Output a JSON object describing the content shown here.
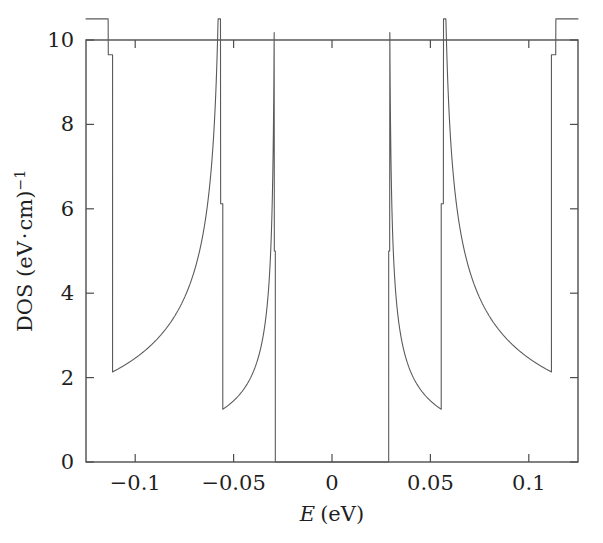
{
  "chart_data": {
    "type": "line",
    "title": "",
    "subtitle": "",
    "xlabel": "E (eV)",
    "xlabel_symbol": "E",
    "xlabel_units": "(eV)",
    "ylabel": "DOS (eV·cm)⁻¹",
    "ylabel_main": "DOS (eV",
    "ylabel_middot": "·",
    "ylabel_cm": "cm)",
    "ylabel_exponent": "−1",
    "xlim": [
      -0.125,
      0.125
    ],
    "ylim": [
      0,
      10
    ],
    "xticks": [
      -0.1,
      -0.05,
      0,
      0.05,
      0.1
    ],
    "xtick_labels": [
      "−0.1",
      "−0.05",
      "0",
      "0.05",
      "0.1"
    ],
    "yticks": [
      0,
      2,
      4,
      6,
      8,
      10
    ],
    "ytick_labels": [
      "0",
      "2",
      "4",
      "6",
      "8",
      "10"
    ],
    "grid": false,
    "legend": "none",
    "line_color": "#5a5a5a",
    "line_width": 1.1,
    "axes_color": "#4d4d4d",
    "background": "#ffffff",
    "tick_direction": "in",
    "box_frame": true,
    "series": [
      {
        "name": "DOS",
        "description": "Density of states of a semiconducting carbon nanotube showing van Hove singularities, symmetric about E = 0, with a band gap between −0.029 eV and +0.029 eV.",
        "band_gap_eV": 0.0576,
        "gap_edges_eV": [
          -0.0288,
          0.0288
        ],
        "singularities_eV": [
          -0.1115,
          -0.0555,
          -0.0288,
          0.0288,
          0.0555,
          0.1115
        ],
        "singularity_peak_values": [
          9.65,
          6.12,
          5.0,
          5.0,
          6.12,
          9.65
        ],
        "plateau_values": [
          2.25,
          1.15,
          0.0,
          1.15,
          2.25
        ],
        "edge_values": [
          4.24,
          4.24
        ],
        "subbands": [
          {
            "index": 1,
            "onset_eV": 0.0288,
            "prefactor": 2.06,
            "step_value": 5.0,
            "asymptote": 1.15
          },
          {
            "index": 2,
            "onset_eV": 0.0555,
            "prefactor": 2.76,
            "step_value": 6.12,
            "asymptote": 1.1
          },
          {
            "index": 3,
            "onset_eV": 0.1115,
            "prefactor": 4.4,
            "step_value": 9.65,
            "asymptote": 2.25
          }
        ],
        "points": [
          {
            "x": -0.125,
            "y": 4.24
          },
          {
            "x": -0.1115,
            "y": 9.65
          },
          {
            "x": -0.1114,
            "y": 2.25
          },
          {
            "x": -0.09,
            "y": 2.25
          },
          {
            "x": -0.07,
            "y": 2.45
          },
          {
            "x": -0.06,
            "y": 3.1
          },
          {
            "x": -0.0556,
            "y": 6.12
          },
          {
            "x": -0.0554,
            "y": 1.15
          },
          {
            "x": -0.045,
            "y": 1.15
          },
          {
            "x": -0.035,
            "y": 1.45
          },
          {
            "x": -0.0289,
            "y": 5.0
          },
          {
            "x": -0.0288,
            "y": 0.0
          },
          {
            "x": 0.0288,
            "y": 0.0
          },
          {
            "x": 0.0289,
            "y": 5.0
          },
          {
            "x": 0.035,
            "y": 1.45
          },
          {
            "x": 0.045,
            "y": 1.15
          },
          {
            "x": 0.0554,
            "y": 1.15
          },
          {
            "x": 0.0556,
            "y": 6.12
          },
          {
            "x": 0.06,
            "y": 3.1
          },
          {
            "x": 0.07,
            "y": 2.45
          },
          {
            "x": 0.09,
            "y": 2.25
          },
          {
            "x": 0.1114,
            "y": 2.25
          },
          {
            "x": 0.1115,
            "y": 9.65
          },
          {
            "x": 0.125,
            "y": 4.24
          }
        ]
      }
    ]
  },
  "figure": {
    "plot_box": {
      "left": 86,
      "top": 40,
      "right": 578,
      "bottom": 462
    }
  }
}
